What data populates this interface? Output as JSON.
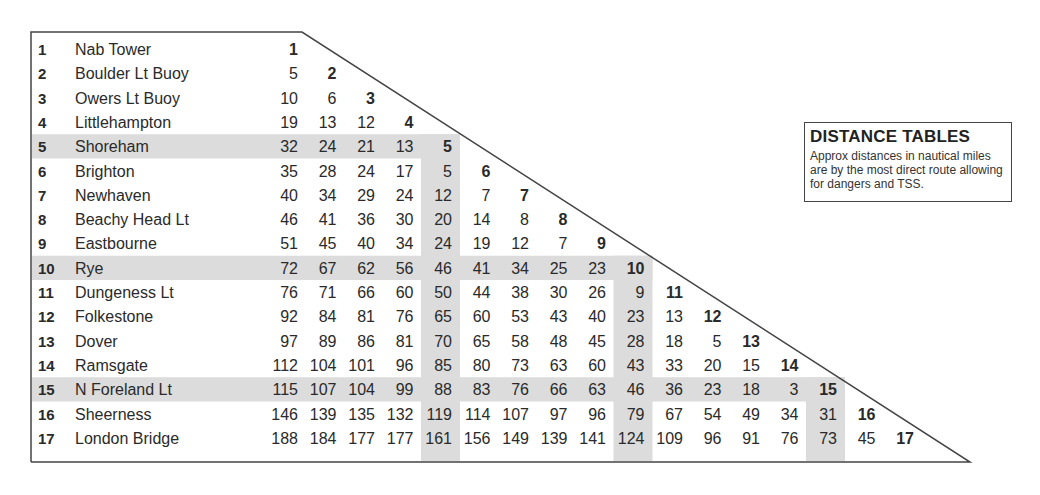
{
  "note": {
    "title": "DISTANCE TABLES",
    "text": "Approx distances in nautical miles are by the most direct route allowing for dangers and TSS."
  },
  "colors": {
    "shade": "#dcdcdc",
    "text": "#2a2a2a",
    "border": "#444444"
  },
  "table": {
    "shaded_indices": [
      5,
      10,
      15
    ],
    "places": [
      {
        "n": "1",
        "name": "Nab Tower",
        "d": []
      },
      {
        "n": "2",
        "name": "Boulder Lt Buoy",
        "d": [
          "5"
        ]
      },
      {
        "n": "3",
        "name": "Owers Lt Buoy",
        "d": [
          "10",
          "6"
        ]
      },
      {
        "n": "4",
        "name": "Littlehampton",
        "d": [
          "19",
          "13",
          "12"
        ]
      },
      {
        "n": "5",
        "name": "Shoreham",
        "d": [
          "32",
          "24",
          "21",
          "13"
        ]
      },
      {
        "n": "6",
        "name": "Brighton",
        "d": [
          "35",
          "28",
          "24",
          "17",
          "5"
        ]
      },
      {
        "n": "7",
        "name": "Newhaven",
        "d": [
          "40",
          "34",
          "29",
          "24",
          "12",
          "7"
        ]
      },
      {
        "n": "8",
        "name": "Beachy Head Lt",
        "d": [
          "46",
          "41",
          "36",
          "30",
          "20",
          "14",
          "8"
        ]
      },
      {
        "n": "9",
        "name": "Eastbourne",
        "d": [
          "51",
          "45",
          "40",
          "34",
          "24",
          "19",
          "12",
          "7"
        ]
      },
      {
        "n": "10",
        "name": "Rye",
        "d": [
          "72",
          "67",
          "62",
          "56",
          "46",
          "41",
          "34",
          "25",
          "23"
        ]
      },
      {
        "n": "11",
        "name": "Dungeness Lt",
        "d": [
          "76",
          "71",
          "66",
          "60",
          "50",
          "44",
          "38",
          "30",
          "26",
          "9"
        ]
      },
      {
        "n": "12",
        "name": "Folkestone",
        "d": [
          "92",
          "84",
          "81",
          "76",
          "65",
          "60",
          "53",
          "43",
          "40",
          "23",
          "13"
        ]
      },
      {
        "n": "13",
        "name": "Dover",
        "d": [
          "97",
          "89",
          "86",
          "81",
          "70",
          "65",
          "58",
          "48",
          "45",
          "28",
          "18",
          "5"
        ]
      },
      {
        "n": "14",
        "name": "Ramsgate",
        "d": [
          "112",
          "104",
          "101",
          "96",
          "85",
          "80",
          "73",
          "63",
          "60",
          "43",
          "33",
          "20",
          "15"
        ]
      },
      {
        "n": "15",
        "name": "N Foreland Lt",
        "d": [
          "115",
          "107",
          "104",
          "99",
          "88",
          "83",
          "76",
          "66",
          "63",
          "46",
          "36",
          "23",
          "18",
          "3"
        ]
      },
      {
        "n": "16",
        "name": "Sheerness",
        "d": [
          "146",
          "139",
          "135",
          "132",
          "119",
          "114",
          "107",
          "97",
          "96",
          "79",
          "67",
          "54",
          "49",
          "34",
          "31"
        ]
      },
      {
        "n": "17",
        "name": "London Bridge",
        "d": [
          "188",
          "184",
          "177",
          "177",
          "161",
          "156",
          "149",
          "139",
          "141",
          "124",
          "109",
          "96",
          "91",
          "76",
          "73",
          "45"
        ]
      }
    ]
  }
}
